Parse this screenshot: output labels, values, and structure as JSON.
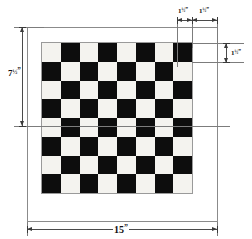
{
  "drawing": {
    "title": "Checkerboard layout drawing",
    "subject": "checkerboard",
    "grid": {
      "rows": 8,
      "cols": 8,
      "top_left_square": "light"
    },
    "colors": {
      "light_square": "#f4f3ef",
      "dark_square": "#0d0d0d",
      "board_background": "#ffffff",
      "line": "#4a4a4a",
      "extension_line": "#7c7c7c",
      "text": "#111111"
    }
  },
  "dimensions": {
    "square_width": {
      "value": "1",
      "fraction": "½",
      "unit": "”",
      "label": "1½”",
      "position": "top-left-of-pair"
    },
    "border_margin": {
      "value": "1",
      "fraction": "½",
      "unit": "”",
      "label": "1½”",
      "position": "top-right-of-pair"
    },
    "square_height": {
      "value": "1",
      "fraction": "½",
      "unit": "”",
      "label": "1½”",
      "position": "right"
    },
    "half_height": {
      "value": "7",
      "fraction": "½",
      "unit": "”",
      "label": "7½”",
      "position": "left"
    },
    "overall_width": {
      "value": "15",
      "fraction": "",
      "unit": "”",
      "label": "15”",
      "position": "bottom"
    }
  },
  "squares": [
    "light",
    "dark",
    "light",
    "dark",
    "light",
    "dark",
    "light",
    "dark",
    "dark",
    "light",
    "dark",
    "light",
    "dark",
    "light",
    "dark",
    "light",
    "light",
    "dark",
    "light",
    "dark",
    "light",
    "dark",
    "light",
    "dark",
    "dark",
    "light",
    "dark",
    "light",
    "dark",
    "light",
    "dark",
    "light",
    "light",
    "dark",
    "light",
    "dark",
    "light",
    "dark",
    "light",
    "dark",
    "dark",
    "light",
    "dark",
    "light",
    "dark",
    "light",
    "dark",
    "light",
    "light",
    "dark",
    "light",
    "dark",
    "light",
    "dark",
    "light",
    "dark",
    "dark",
    "light",
    "dark",
    "light",
    "dark",
    "light",
    "dark",
    "light"
  ]
}
